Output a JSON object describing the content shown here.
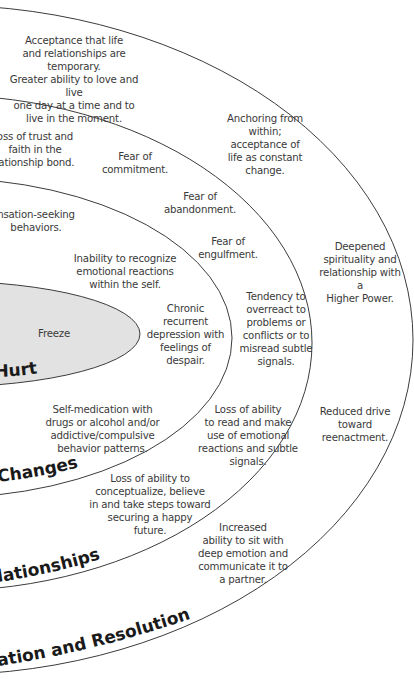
{
  "diagram": {
    "colors": {
      "line": "#3c3c3c",
      "core_fill": "#e2e2e2",
      "text": "#3a3a3a",
      "label": "#1a1a1a",
      "background": "#ffffff"
    },
    "zones": [
      {
        "id": "hurt",
        "label": "Hurt",
        "core_label": "Freeze",
        "notes": []
      },
      {
        "id": "changes",
        "label": "Changes",
        "notes": [
          "Inability to recognize\nemotional reactions\nwithin the self.",
          "Chronic recurrent\ndepression with\nfeelings of\ndespair.",
          "Self-medication with\ndrugs or alcohol and/or\naddictive/compulsive\nbehavior patterns."
        ]
      },
      {
        "id": "relationships",
        "label": "lationships",
        "notes": [
          "nsation-seeking\nbehaviors.",
          "Fear of\nabandonment.",
          "Fear of\nengulfment.",
          "Tendency to\noverreact to\nproblems or\nconflicts or to\nmisread subtle\nsignals.",
          "Loss of ability\nto read and make\nuse of emotional\nreactions and subtle\nsignals.",
          "Loss of ability to\nconceptualize, believe\nin and take steps toward\nsecuring a happy\nfuture."
        ]
      },
      {
        "id": "resolution",
        "label": "ation and Resolution",
        "notes": [
          "oss of trust and\nfaith in the\nlationship bond.",
          "Fear of\ncommitment.",
          "Anchoring from\nwithin;\nacceptance of\nlife as constant change.",
          "Deepened\nspirituality and\nrelationship with a\nHigher Power.",
          "Reduced drive\ntoward\nreenactment.",
          "Increased\nability to sit with\ndeep emotion and\ncommunicate it to\na partner."
        ]
      },
      {
        "id": "outer",
        "notes": [
          "Acceptance that life\nand relationships are temporary.\nGreater ability to love and live\none day at a time and to\nlive in the moment."
        ]
      }
    ]
  }
}
